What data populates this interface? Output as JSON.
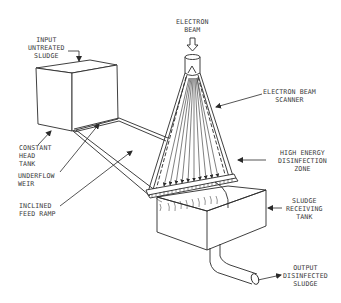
{
  "diagram": {
    "colors": {
      "line": "#2a2a2a",
      "text": "#3a3a3a",
      "background": "#ffffff"
    },
    "labels": {
      "input_untreated_sludge": "INPUT\nUNTREATED\nSLUDGE",
      "electron_beam": "ELECTRON\nBEAM",
      "electron_beam_scanner": "ELECTRON BEAM\nSCANNER",
      "constant_head_tank": "CONSTANT\nHEAD\nTANK",
      "underflow_weir": "UNDERFLOW\nWEIR",
      "high_energy_disinfection_zone": "HIGH ENERGY\nDISINFECTION\nZONE",
      "inclined_feed_ramp": "INCLINED\nFEED RAMP",
      "sludge_receiving_tank": "SLUDGE\nRECEIVING\nTANK",
      "output_disinfected_sludge": "OUTPUT\nDISINFECTED\nSLUDGE"
    },
    "components": [
      "constant-head-tank",
      "underflow-weir",
      "inclined-feed-ramp",
      "electron-beam-source",
      "electron-beam-scanner",
      "high-energy-disinfection-zone",
      "sludge-receiving-tank",
      "output-pipe"
    ]
  }
}
